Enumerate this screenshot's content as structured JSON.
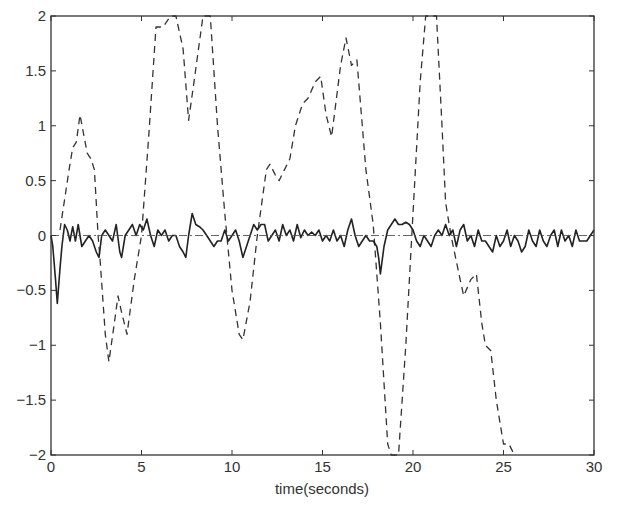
{
  "chart_data": {
    "type": "line",
    "title": "",
    "xlabel": "time(seconds)",
    "ylabel": "",
    "xlim": [
      0,
      30
    ],
    "ylim": [
      -2,
      2
    ],
    "xticks": [
      0,
      5,
      10,
      15,
      20,
      25,
      30
    ],
    "yticks": [
      -2,
      -1.5,
      -1,
      -0.5,
      0,
      0.5,
      1,
      1.5,
      2
    ],
    "xtick_labels": [
      "0",
      "5",
      "10",
      "15",
      "20",
      "25",
      "30"
    ],
    "ytick_labels": [
      "-2",
      "-1.5",
      "-1",
      "-0.5",
      "0",
      "0.5",
      "1",
      "1.5",
      "2"
    ],
    "grid": false,
    "legend": null,
    "series": [
      {
        "name": "dashed signal",
        "style": "dashed",
        "color": "#333333",
        "points": [
          [
            0.5,
            0.05
          ],
          [
            1.0,
            0.6
          ],
          [
            1.2,
            0.8
          ],
          [
            1.4,
            0.85
          ],
          [
            1.6,
            1.1
          ],
          [
            2.0,
            0.75
          ],
          [
            2.2,
            0.7
          ],
          [
            2.4,
            0.6
          ],
          [
            2.6,
            0.0
          ],
          [
            2.7,
            -0.2
          ],
          [
            3.0,
            -0.9
          ],
          [
            3.2,
            -1.15
          ],
          [
            3.5,
            -0.8
          ],
          [
            3.7,
            -0.55
          ],
          [
            3.9,
            -0.7
          ],
          [
            4.2,
            -0.9
          ],
          [
            4.6,
            -0.4
          ],
          [
            5.0,
            0.0
          ],
          [
            5.4,
            0.9
          ],
          [
            5.8,
            1.9
          ],
          [
            6.2,
            1.9
          ],
          [
            6.6,
            2.0
          ],
          [
            6.9,
            2.0
          ],
          [
            7.3,
            1.7
          ],
          [
            7.6,
            1.05
          ],
          [
            7.9,
            1.4
          ],
          [
            8.4,
            2.0
          ],
          [
            8.8,
            2.0
          ],
          [
            9.2,
            1.0
          ],
          [
            9.6,
            0.2
          ],
          [
            10.0,
            -0.5
          ],
          [
            10.4,
            -0.9
          ],
          [
            10.6,
            -0.95
          ],
          [
            11.0,
            -0.6
          ],
          [
            11.4,
            0.0
          ],
          [
            11.9,
            0.6
          ],
          [
            12.1,
            0.65
          ],
          [
            12.4,
            0.55
          ],
          [
            12.6,
            0.5
          ],
          [
            12.9,
            0.6
          ],
          [
            13.2,
            0.7
          ],
          [
            13.5,
            1.0
          ],
          [
            13.9,
            1.2
          ],
          [
            14.2,
            1.25
          ],
          [
            14.6,
            1.4
          ],
          [
            14.9,
            1.45
          ],
          [
            15.2,
            1.1
          ],
          [
            15.5,
            0.9
          ],
          [
            16.0,
            1.55
          ],
          [
            16.3,
            1.8
          ],
          [
            16.6,
            1.55
          ],
          [
            16.9,
            1.6
          ],
          [
            17.4,
            0.6
          ],
          [
            17.8,
            0.1
          ],
          [
            18.2,
            -0.8
          ],
          [
            18.6,
            -1.9
          ],
          [
            18.8,
            -2.0
          ],
          [
            19.2,
            -2.0
          ],
          [
            19.6,
            -1.0
          ],
          [
            20.0,
            0.2
          ],
          [
            20.4,
            1.4
          ],
          [
            20.7,
            2.0
          ],
          [
            21.3,
            2.0
          ],
          [
            21.6,
            1.0
          ],
          [
            21.8,
            0.3
          ],
          [
            22.1,
            0.0
          ],
          [
            22.6,
            -0.4
          ],
          [
            22.8,
            -0.55
          ],
          [
            23.2,
            -0.4
          ],
          [
            23.5,
            -0.35
          ],
          [
            23.8,
            -0.8
          ],
          [
            24.0,
            -1.0
          ],
          [
            24.3,
            -1.05
          ],
          [
            24.6,
            -1.5
          ],
          [
            25.0,
            -1.9
          ],
          [
            25.3,
            -1.9
          ],
          [
            25.6,
            -2.0
          ]
        ]
      },
      {
        "name": "solid signal",
        "style": "solid",
        "color": "#222222",
        "points": [
          [
            0.0,
            0.0
          ],
          [
            0.1,
            -0.1
          ],
          [
            0.25,
            -0.4
          ],
          [
            0.35,
            -0.62
          ],
          [
            0.5,
            -0.3
          ],
          [
            0.6,
            -0.1
          ],
          [
            0.75,
            0.1
          ],
          [
            0.9,
            0.05
          ],
          [
            1.05,
            -0.05
          ],
          [
            1.2,
            0.08
          ],
          [
            1.35,
            -0.05
          ],
          [
            1.5,
            0.1
          ],
          [
            1.7,
            -0.1
          ],
          [
            1.9,
            -0.05
          ],
          [
            2.1,
            0.0
          ],
          [
            2.3,
            -0.05
          ],
          [
            2.5,
            -0.15
          ],
          [
            2.65,
            -0.2
          ],
          [
            2.8,
            0.0
          ],
          [
            3.0,
            0.05
          ],
          [
            3.2,
            0.0
          ],
          [
            3.4,
            -0.05
          ],
          [
            3.6,
            0.1
          ],
          [
            3.8,
            -0.15
          ],
          [
            3.9,
            -0.2
          ],
          [
            4.1,
            0.0
          ],
          [
            4.3,
            0.05
          ],
          [
            4.5,
            0.1
          ],
          [
            4.7,
            0.0
          ],
          [
            4.9,
            0.1
          ],
          [
            5.1,
            0.05
          ],
          [
            5.3,
            0.15
          ],
          [
            5.5,
            0.0
          ],
          [
            5.7,
            -0.1
          ],
          [
            5.9,
            0.05
          ],
          [
            6.1,
            0.0
          ],
          [
            6.3,
            0.05
          ],
          [
            6.5,
            -0.05
          ],
          [
            6.7,
            0.0
          ],
          [
            6.9,
            0.0
          ],
          [
            7.1,
            -0.1
          ],
          [
            7.3,
            -0.15
          ],
          [
            7.45,
            -0.2
          ],
          [
            7.6,
            0.0
          ],
          [
            7.8,
            0.2
          ],
          [
            8.0,
            0.1
          ],
          [
            8.2,
            0.08
          ],
          [
            8.4,
            0.05
          ],
          [
            8.6,
            0.0
          ],
          [
            8.8,
            -0.05
          ],
          [
            9.0,
            -0.1
          ],
          [
            9.2,
            -0.05
          ],
          [
            9.4,
            -0.05
          ],
          [
            9.6,
            0.05
          ],
          [
            9.8,
            -0.05
          ],
          [
            10.0,
            0.0
          ],
          [
            10.2,
            0.05
          ],
          [
            10.4,
            -0.05
          ],
          [
            10.6,
            -0.2
          ],
          [
            10.8,
            -0.1
          ],
          [
            11.0,
            0.0
          ],
          [
            11.2,
            0.1
          ],
          [
            11.4,
            0.05
          ],
          [
            11.6,
            0.1
          ],
          [
            11.8,
            0.1
          ],
          [
            12.0,
            -0.05
          ],
          [
            12.2,
            0.0
          ],
          [
            12.4,
            0.05
          ],
          [
            12.6,
            -0.05
          ],
          [
            12.8,
            0.1
          ],
          [
            13.0,
            0.0
          ],
          [
            13.2,
            0.05
          ],
          [
            13.4,
            -0.05
          ],
          [
            13.6,
            0.1
          ],
          [
            13.8,
            -0.02
          ],
          [
            14.0,
            0.05
          ],
          [
            14.2,
            0.0
          ],
          [
            14.4,
            0.03
          ],
          [
            14.6,
            0.0
          ],
          [
            14.8,
            0.05
          ],
          [
            15.0,
            -0.05
          ],
          [
            15.2,
            0.0
          ],
          [
            15.4,
            -0.05
          ],
          [
            15.6,
            0.05
          ],
          [
            15.8,
            -0.05
          ],
          [
            16.0,
            0.0
          ],
          [
            16.2,
            -0.1
          ],
          [
            16.4,
            0.05
          ],
          [
            16.6,
            0.15
          ],
          [
            16.8,
            0.0
          ],
          [
            17.0,
            -0.1
          ],
          [
            17.2,
            -0.05
          ],
          [
            17.4,
            0.0
          ],
          [
            17.6,
            -0.05
          ],
          [
            17.8,
            -0.05
          ],
          [
            18.0,
            -0.1
          ],
          [
            18.1,
            -0.2
          ],
          [
            18.2,
            -0.35
          ],
          [
            18.4,
            -0.1
          ],
          [
            18.6,
            0.05
          ],
          [
            18.8,
            0.1
          ],
          [
            19.0,
            0.15
          ],
          [
            19.2,
            0.1
          ],
          [
            19.4,
            0.1
          ],
          [
            19.6,
            0.12
          ],
          [
            19.8,
            0.1
          ],
          [
            20.0,
            0.05
          ],
          [
            20.2,
            -0.05
          ],
          [
            20.4,
            -0.1
          ],
          [
            20.6,
            0.0
          ],
          [
            20.8,
            -0.05
          ],
          [
            21.0,
            -0.1
          ],
          [
            21.2,
            0.0
          ],
          [
            21.4,
            0.05
          ],
          [
            21.6,
            0.0
          ],
          [
            21.8,
            0.1
          ],
          [
            22.0,
            0.0
          ],
          [
            22.2,
            0.05
          ],
          [
            22.4,
            -0.1
          ],
          [
            22.6,
            0.05
          ],
          [
            22.8,
            0.1
          ],
          [
            23.0,
            -0.05
          ],
          [
            23.2,
            0.0
          ],
          [
            23.4,
            -0.1
          ],
          [
            23.6,
            0.05
          ],
          [
            23.8,
            -0.05
          ],
          [
            24.0,
            -0.05
          ],
          [
            24.2,
            -0.1
          ],
          [
            24.4,
            -0.15
          ],
          [
            24.6,
            0.0
          ],
          [
            24.8,
            -0.1
          ],
          [
            25.0,
            -0.05
          ],
          [
            25.2,
            0.05
          ],
          [
            25.4,
            -0.1
          ],
          [
            25.6,
            0.0
          ],
          [
            25.8,
            -0.05
          ],
          [
            26.0,
            -0.15
          ],
          [
            26.2,
            -0.1
          ],
          [
            26.4,
            0.05
          ],
          [
            26.6,
            -0.05
          ],
          [
            26.8,
            -0.1
          ],
          [
            27.0,
            0.05
          ],
          [
            27.2,
            -0.05
          ],
          [
            27.4,
            -0.1
          ],
          [
            27.6,
            0.0
          ],
          [
            27.8,
            0.05
          ],
          [
            28.0,
            -0.1
          ],
          [
            28.2,
            0.05
          ],
          [
            28.4,
            -0.05
          ],
          [
            28.6,
            0.0
          ],
          [
            28.8,
            -0.1
          ],
          [
            29.0,
            0.05
          ],
          [
            29.2,
            -0.05
          ],
          [
            29.4,
            -0.05
          ],
          [
            29.6,
            -0.05
          ],
          [
            29.8,
            0.0
          ],
          [
            30.0,
            0.05
          ]
        ]
      },
      {
        "name": "zero reference",
        "style": "dash-dot",
        "color": "#555555",
        "points": [
          [
            0,
            0
          ],
          [
            30,
            0
          ]
        ]
      }
    ]
  }
}
